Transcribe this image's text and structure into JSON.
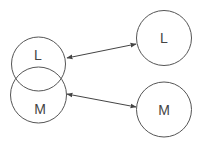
{
  "diagram": {
    "style": {
      "stroke": "#555555",
      "text": "#444444",
      "background": "#ffffff"
    },
    "nodes": [
      {
        "id": "left-L",
        "label": "L",
        "cx": 38.5,
        "cy": 64,
        "r": 27,
        "lx": 38,
        "ly": 60
      },
      {
        "id": "left-M",
        "label": "M",
        "cx": 38.5,
        "cy": 95,
        "r": 28,
        "lx": 40,
        "ly": 114
      },
      {
        "id": "right-L",
        "label": "L",
        "cx": 164,
        "cy": 38,
        "r": 27.5,
        "lx": 164,
        "ly": 43
      },
      {
        "id": "right-M",
        "label": "M",
        "cx": 164,
        "cy": 109.5,
        "r": 27.5,
        "lx": 164,
        "ly": 115
      }
    ],
    "edges": [
      {
        "from": "left-L",
        "to": "right-L",
        "type": "bidirectional",
        "x1": 67,
        "y1": 58,
        "x2": 136,
        "y2": 44
      },
      {
        "from": "left-M",
        "to": "right-M",
        "type": "bidirectional",
        "x1": 67,
        "y1": 94,
        "x2": 136,
        "y2": 107
      }
    ]
  }
}
